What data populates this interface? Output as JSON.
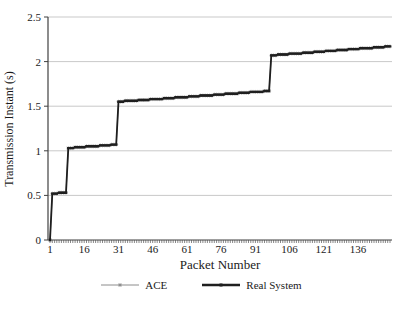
{
  "figure": {
    "background": "#ffffff"
  },
  "chart_data": {
    "type": "line",
    "subtype": "step-trace",
    "title": "",
    "xlabel": "Packet Number",
    "ylabel": "Transmission Instant (s)",
    "xlim": [
      1,
      150
    ],
    "ylim": [
      0,
      2.5
    ],
    "x_ticks": [
      1,
      16,
      31,
      46,
      61,
      76,
      91,
      106,
      121,
      136
    ],
    "y_ticks": [
      0,
      0.5,
      1,
      1.5,
      2,
      2.5
    ],
    "grid": "horizontal-only",
    "grid_color": "#c9c9c9",
    "axis_color": "#404040",
    "minor_tick_color": "#555555",
    "text_color": "#1a1a1a",
    "x_axis_minor_ticks": "every-packet",
    "legend_position": "bottom-center",
    "step_quantum": 0.01,
    "series": [
      {
        "name": "ACE",
        "color": "#8c8c8c",
        "marker": "star",
        "line_width": 1,
        "segments": [
          {
            "packet_start": 1,
            "packet_end": 1,
            "value_start": 0,
            "value_end": 0
          },
          {
            "packet_start": 2,
            "packet_end": 8,
            "value_start": 0.52,
            "value_end": 0.53
          },
          {
            "packet_start": 9,
            "packet_end": 30,
            "value_start": 1.03,
            "value_end": 1.07
          },
          {
            "packet_start": 31,
            "packet_end": 97,
            "value_start": 1.55,
            "value_end": 1.67
          },
          {
            "packet_start": 98,
            "packet_end": 150,
            "value_start": 2.07,
            "value_end": 2.17
          }
        ]
      },
      {
        "name": "Real System",
        "color": "#1f1f1f",
        "marker": "square",
        "line_width": 1.8,
        "segments": [
          {
            "packet_start": 1,
            "packet_end": 1,
            "value_start": 0,
            "value_end": 0
          },
          {
            "packet_start": 2,
            "packet_end": 8,
            "value_start": 0.52,
            "value_end": 0.53
          },
          {
            "packet_start": 9,
            "packet_end": 30,
            "value_start": 1.03,
            "value_end": 1.07
          },
          {
            "packet_start": 31,
            "packet_end": 97,
            "value_start": 1.55,
            "value_end": 1.67
          },
          {
            "packet_start": 98,
            "packet_end": 150,
            "value_start": 2.07,
            "value_end": 2.17
          }
        ]
      }
    ]
  }
}
